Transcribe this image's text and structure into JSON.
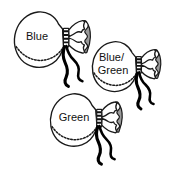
{
  "figure": {
    "background_color": "#ffffff",
    "ink_color": "#111111",
    "shade_color": "#9a9a9a",
    "width": 179,
    "height": 174,
    "items": [
      {
        "id": "blue",
        "label": "Blue",
        "label_lines": [
          "Blue"
        ],
        "position": {
          "x": 14,
          "y": 10
        }
      },
      {
        "id": "blue-green",
        "label": "Blue/Green",
        "label_lines": [
          "Blue/",
          "Green"
        ],
        "position": {
          "x": 92,
          "y": 40
        }
      },
      {
        "id": "green",
        "label": "Green",
        "label_lines": [
          "Green"
        ],
        "position": {
          "x": 50,
          "y": 92
        }
      }
    ]
  }
}
